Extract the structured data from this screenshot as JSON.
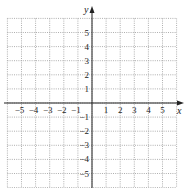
{
  "chart_data": {
    "type": "coordinate-grid",
    "title": "",
    "xlabel": "x",
    "ylabel": "y",
    "xlim": [
      -6,
      6
    ],
    "ylim": [
      -6,
      6
    ],
    "grid": true,
    "grid_style": "dotted",
    "x_tick_labels": [
      "−5",
      "−4",
      "−3",
      "−2",
      "−1",
      "1",
      "2",
      "3",
      "4",
      "5"
    ],
    "x_tick_values": [
      -5,
      -4,
      -3,
      -2,
      -1,
      1,
      2,
      3,
      4,
      5
    ],
    "y_tick_labels": [
      "5",
      "4",
      "3",
      "2",
      "1",
      "−1",
      "−2",
      "−3",
      "−4",
      "−5"
    ],
    "y_tick_values": [
      5,
      4,
      3,
      2,
      1,
      -1,
      -2,
      -3,
      -4,
      -5
    ],
    "series": []
  },
  "axes": {
    "x_label": "x",
    "y_label": "y"
  },
  "colors": {
    "grid": "#9a9a9a",
    "axis": "#222222"
  }
}
